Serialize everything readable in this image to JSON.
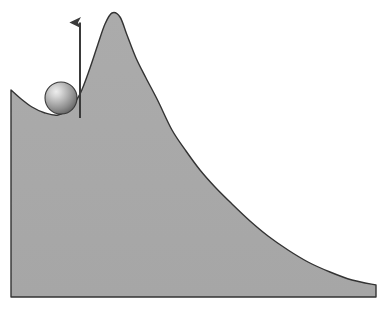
{
  "figure": {
    "title": "Ball resting in a local minimum beside an energy barrier",
    "domain_type": "diagram",
    "background_color": "#ffffff",
    "width": 385,
    "height": 311
  },
  "chart_data": {
    "type": "area",
    "title": "",
    "subtitle": "",
    "xlabel": "",
    "ylabel": "",
    "grid": false,
    "legend": "none",
    "xlim": [
      0,
      385
    ],
    "ylim": [
      311,
      0
    ],
    "axis_visible": false,
    "tick_labels_x": [],
    "tick_labels_y": [],
    "annotations": [
      {
        "name": "ball",
        "shape": "sphere",
        "center_x": 61,
        "center_y": 98,
        "radius": 16,
        "fill_light": "#e8e8e8",
        "fill_mid": "#b4b4b4",
        "fill_dark": "#6e6e6e",
        "stroke": "#3a3a3a"
      },
      {
        "name": "upward-arrow",
        "shape": "arrow",
        "x": 80,
        "y_tail": 118,
        "y_head": 12,
        "direction": "up",
        "color": "#3a3a3a",
        "shaft_width": 2,
        "head_width": 11,
        "head_length": 17
      }
    ],
    "series": [
      {
        "name": "energy-landscape",
        "fill": "#a9a9a9",
        "stroke": "#333333",
        "stroke_width": 1.4,
        "baseline_y": 297,
        "points": [
          {
            "x": 11,
            "y": 90
          },
          {
            "x": 20,
            "y": 98
          },
          {
            "x": 32,
            "y": 107
          },
          {
            "x": 45,
            "y": 113
          },
          {
            "x": 58,
            "y": 115
          },
          {
            "x": 70,
            "y": 108
          },
          {
            "x": 80,
            "y": 94
          },
          {
            "x": 90,
            "y": 68
          },
          {
            "x": 98,
            "y": 44
          },
          {
            "x": 105,
            "y": 24
          },
          {
            "x": 112,
            "y": 13
          },
          {
            "x": 120,
            "y": 17
          },
          {
            "x": 127,
            "y": 35
          },
          {
            "x": 136,
            "y": 58
          },
          {
            "x": 146,
            "y": 78
          },
          {
            "x": 158,
            "y": 101
          },
          {
            "x": 172,
            "y": 130
          },
          {
            "x": 186,
            "y": 151
          },
          {
            "x": 200,
            "y": 170
          },
          {
            "x": 215,
            "y": 187
          },
          {
            "x": 232,
            "y": 204
          },
          {
            "x": 250,
            "y": 221
          },
          {
            "x": 268,
            "y": 236
          },
          {
            "x": 288,
            "y": 250
          },
          {
            "x": 308,
            "y": 262
          },
          {
            "x": 330,
            "y": 272
          },
          {
            "x": 352,
            "y": 280
          },
          {
            "x": 376,
            "y": 285
          }
        ]
      }
    ]
  }
}
